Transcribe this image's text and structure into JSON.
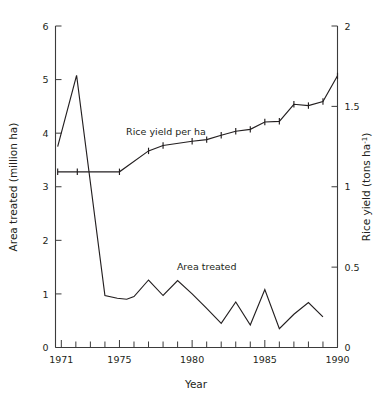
{
  "chart_data": {
    "type": "line",
    "title": "",
    "xlabel": "Year",
    "ylabel_left": "Area treated (million ha)",
    "ylabel_right": "Rice yield (tons ha",
    "ylabel_right_sup": "-1",
    "ylabel_right_tail": ")",
    "grid": false,
    "legend_position": "inline-annotations",
    "xlim": [
      1970.6,
      1990
    ],
    "xticks_major": [
      1971,
      1975,
      1980,
      1985,
      1990
    ],
    "xticks_major_labels": [
      "1971",
      "1975",
      "1980",
      "1985",
      "1990"
    ],
    "xticks_minor": [
      1972,
      1973,
      1974,
      1976,
      1977,
      1978,
      1979,
      1981,
      1982,
      1983,
      1984,
      1986,
      1987,
      1988,
      1989
    ],
    "ylim_left": [
      0,
      6
    ],
    "yticks_left": [
      0,
      1,
      2,
      3,
      4,
      5,
      6
    ],
    "yticks_left_labels": [
      "0",
      "1",
      "2",
      "3",
      "4",
      "5",
      "6"
    ],
    "ylim_right": [
      0,
      2
    ],
    "yticks_right": [
      0,
      0.5,
      1,
      1.5,
      2
    ],
    "yticks_right_labels": [
      "0",
      "0.5",
      "1",
      "1.5",
      "2"
    ],
    "series": [
      {
        "name": "Area treated",
        "axis": "left",
        "unit": "million ha",
        "markers": false,
        "annotation": "Area treated",
        "annotation_x": 1981.0,
        "annotation_y": 1.45,
        "x": [
          1970.75,
          1972.05,
          1974.0,
          1974.85,
          1975.5,
          1976.0,
          1977.0,
          1978.0,
          1979.0,
          1980.0,
          1981.0,
          1982.0,
          1983.0,
          1984.0,
          1985.0,
          1986.0,
          1987.0,
          1988.0,
          1989.0
        ],
        "y": [
          3.75,
          5.08,
          0.97,
          0.92,
          0.9,
          0.95,
          1.26,
          0.97,
          1.25,
          1.0,
          0.73,
          0.45,
          0.85,
          0.42,
          1.08,
          0.35,
          0.62,
          0.84,
          0.57
        ]
      },
      {
        "name": "Rice yield per ha",
        "axis": "right",
        "unit": "tons ha-1",
        "markers": true,
        "annotation": "Rice yield per ha",
        "annotation_x": 1978.2,
        "annotation_y": 1.32,
        "x": [
          1970.75,
          1972.1,
          1975.0,
          1977.0,
          1978.0,
          1980.0,
          1981.0,
          1982.0,
          1983.0,
          1984.0,
          1985.0,
          1986.0,
          1987.0,
          1988.0,
          1989.0,
          1990.0
        ],
        "y": [
          1.093,
          1.093,
          1.093,
          1.223,
          1.257,
          1.283,
          1.293,
          1.32,
          1.345,
          1.357,
          1.403,
          1.407,
          1.513,
          1.505,
          1.53,
          1.69
        ],
        "y_left_equiv": [
          3.28,
          3.28,
          3.28,
          3.67,
          3.77,
          3.85,
          3.88,
          3.96,
          4.04,
          4.07,
          4.21,
          4.22,
          4.54,
          4.52,
          4.59,
          5.07
        ]
      }
    ]
  }
}
